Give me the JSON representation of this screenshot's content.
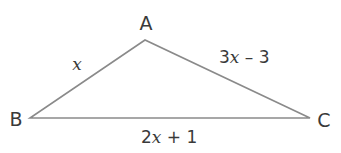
{
  "diagram": {
    "type": "triangle",
    "stroke_color": "#8a8a8a",
    "text_color": "#3a3a3a",
    "vertices": {
      "A": {
        "label": "A",
        "x": 145,
        "y": 40
      },
      "B": {
        "label": "B",
        "x": 30,
        "y": 118
      },
      "C": {
        "label": "C",
        "x": 310,
        "y": 118
      }
    },
    "sides": {
      "AB": {
        "prefix": "",
        "variable": "x",
        "suffix": ""
      },
      "AC": {
        "prefix": "3",
        "variable": "x",
        "suffix": " – 3"
      },
      "BC": {
        "prefix": "2",
        "variable": "x",
        "suffix": " + 1"
      }
    }
  }
}
